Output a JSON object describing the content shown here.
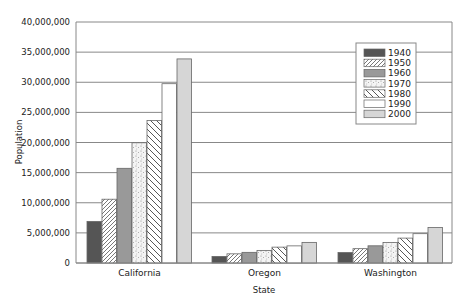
{
  "chart_data": {
    "type": "bar",
    "title": "",
    "xlabel": "State",
    "ylabel": "Population",
    "ylim": [
      0,
      40000000
    ],
    "yticks": [
      0,
      5000000,
      10000000,
      15000000,
      20000000,
      25000000,
      30000000,
      35000000,
      40000000
    ],
    "ytick_labels": [
      "0",
      "5,000,000",
      "10,000,000",
      "15,000,000",
      "20,000,000",
      "25,000,000",
      "30,000,000",
      "35,000,000",
      "40,000,000"
    ],
    "grid": true,
    "legend_position": "upper right inside",
    "categories": [
      "California",
      "Oregon",
      "Washington"
    ],
    "series": [
      {
        "name": "1940",
        "values": [
          6907387,
          1089684,
          1736191
        ]
      },
      {
        "name": "1950",
        "values": [
          10586223,
          1521341,
          2378963
        ]
      },
      {
        "name": "1960",
        "values": [
          15717204,
          1768687,
          2853214
        ]
      },
      {
        "name": "1970",
        "values": [
          19953134,
          2091385,
          3409169
        ]
      },
      {
        "name": "1980",
        "values": [
          23667902,
          2633105,
          4132156
        ]
      },
      {
        "name": "1990",
        "values": [
          29760021,
          2842321,
          4866692
        ]
      },
      {
        "name": "2000",
        "values": [
          33871648,
          3421399,
          5894121
        ]
      }
    ]
  }
}
